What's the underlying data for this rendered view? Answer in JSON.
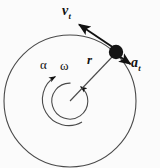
{
  "figure": {
    "kind": "physics-diagram",
    "topic": "circular-motion-kinematics",
    "background_color": "#fbfbfb",
    "stroke_color": "#3a3a3a",
    "ink_color": "#111111",
    "width": 160,
    "height": 168,
    "labels": {
      "tangential_velocity": {
        "symbol": "v",
        "subscript": "t"
      },
      "tangential_acceleration": {
        "symbol": "a",
        "subscript": "t"
      },
      "radius": {
        "symbol": "r",
        "subscript": ""
      },
      "angular_acceleration": {
        "symbol": "α",
        "subscript": ""
      },
      "angular_velocity": {
        "symbol": "ω",
        "subscript": ""
      }
    },
    "geometry": {
      "center": {
        "x": 70,
        "y": 101
      },
      "main_circle_radius": 66,
      "omega_arc_radius": 18,
      "alpha_arc_radius": 26,
      "particle": {
        "x": 116,
        "y": 52,
        "radius": 7
      },
      "vt_arrow_tip": {
        "x": 77,
        "y": 23
      },
      "at_arrow_tip": {
        "x": 133,
        "y": 66
      }
    }
  }
}
